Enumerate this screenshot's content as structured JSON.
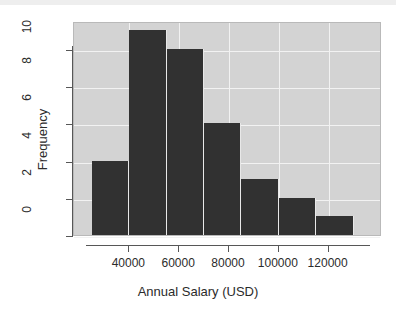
{
  "chart_data": {
    "type": "bar",
    "title": "",
    "xlabel": "Annual Salary (USD)",
    "ylabel": "Frequency",
    "grid": true,
    "legend": null,
    "plot_background_color": "#d3d3d3",
    "bar_color": "#313131",
    "gridline_color": "#f2f2f2",
    "histogram": true,
    "bin_edges": [
      25000,
      40000,
      55000,
      70000,
      85000,
      100000,
      115000,
      130000
    ],
    "bin_width": 15000,
    "categories": [
      "25000-40000",
      "40000-55000",
      "55000-70000",
      "70000-85000",
      "85000-100000",
      "100000-115000",
      "115000-130000"
    ],
    "values": [
      4,
      11,
      10,
      6,
      3,
      2,
      1
    ],
    "xlim": [
      23000,
      137000
    ],
    "ylim": [
      0,
      11.5
    ],
    "xticks": [
      40000,
      60000,
      80000,
      100000,
      120000
    ],
    "xtick_labels": [
      "40000",
      "60000",
      "80000",
      "100000",
      "120000"
    ],
    "yticks": [
      0,
      2,
      4,
      6,
      8,
      10
    ],
    "ytick_labels": [
      "0",
      "2",
      "4",
      "6",
      "8",
      "10"
    ]
  },
  "axes": {
    "y_title": "Frequency",
    "x_title": "Annual Salary (USD)"
  }
}
